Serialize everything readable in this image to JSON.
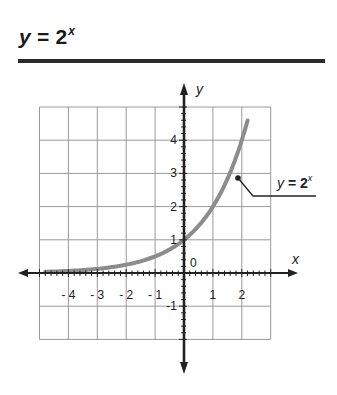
{
  "header": {
    "title_var": "y",
    "title_eq": " = 2",
    "title_exp": "x"
  },
  "colors": {
    "grid": "#9a9a9a",
    "axis": "#222222",
    "curve": "#8c8c8c",
    "rule": "#2a2a2a"
  },
  "chart_data": {
    "type": "line",
    "xlabel": "x",
    "ylabel": "y",
    "xlim": [
      -5,
      3
    ],
    "ylim": [
      -2,
      5
    ],
    "grid": true,
    "x_ticks": [
      -4,
      -3,
      -2,
      -1,
      1,
      2
    ],
    "y_ticks": [
      -1,
      1,
      2,
      3,
      4
    ],
    "origin_label": "0",
    "series": [
      {
        "name": "y = 2^x",
        "function": "2^x",
        "x": [
          -4.8,
          -4,
          -3,
          -2,
          -1,
          0,
          1,
          2,
          2.2
        ],
        "values": [
          0.036,
          0.0625,
          0.125,
          0.25,
          0.5,
          1,
          2,
          4,
          4.6
        ]
      }
    ],
    "annotations": [
      {
        "text": "y = 2^x",
        "points_to": [
          1.8,
          2.9
        ]
      }
    ]
  },
  "callout": {
    "var": "y",
    "eq": " = 2",
    "exp": "x"
  }
}
